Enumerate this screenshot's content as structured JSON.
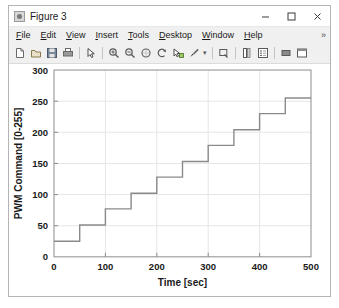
{
  "window": {
    "title": "Figure 3",
    "icon": "matlab-figure-icon",
    "controls": {
      "minimize": "minimize-icon",
      "maximize": "maximize-icon",
      "close": "close-icon"
    }
  },
  "menu": {
    "items": [
      {
        "label": "File",
        "mnemonic": "F"
      },
      {
        "label": "Edit",
        "mnemonic": "E"
      },
      {
        "label": "View",
        "mnemonic": "V"
      },
      {
        "label": "Insert",
        "mnemonic": "I"
      },
      {
        "label": "Tools",
        "mnemonic": "T"
      },
      {
        "label": "Desktop",
        "mnemonic": "D"
      },
      {
        "label": "Window",
        "mnemonic": "W"
      },
      {
        "label": "Help",
        "mnemonic": "H"
      }
    ],
    "overflow": "»"
  },
  "toolbar": {
    "groups": [
      [
        "new-figure-icon",
        "open-file-icon",
        "save-figure-icon",
        "print-figure-icon"
      ],
      [
        "pointer-icon"
      ],
      [
        "zoom-in-icon",
        "zoom-out-icon",
        "pan-icon",
        "rotate-3d-icon",
        "data-cursor-icon",
        "brush-icon"
      ],
      [
        "link-plot-icon"
      ],
      [
        "insert-colorbar-icon",
        "insert-legend-icon"
      ],
      [
        "hide-plot-tools-icon",
        "show-plot-tools-icon"
      ]
    ]
  },
  "chart_data": {
    "type": "line",
    "title": "",
    "xlabel": "Time [sec]",
    "ylabel": "PWM Command [0-255]",
    "xlim": [
      0,
      500
    ],
    "ylim": [
      0,
      300
    ],
    "xticks": [
      0,
      100,
      200,
      300,
      400,
      500
    ],
    "yticks": [
      0,
      50,
      100,
      150,
      200,
      250,
      300
    ],
    "grid": true,
    "legend": null,
    "line_color": "#8a8a8a",
    "series": [
      {
        "name": "PWM staircase command",
        "step": "post",
        "x": [
          0,
          50,
          50,
          100,
          100,
          150,
          150,
          200,
          200,
          250,
          250,
          300,
          300,
          350,
          350,
          400,
          400,
          450,
          450,
          500
        ],
        "y": [
          25,
          25,
          51,
          51,
          77,
          77,
          102,
          102,
          128,
          128,
          153,
          153,
          179,
          179,
          204,
          204,
          230,
          230,
          255,
          255
        ],
        "levels": [
          25,
          51,
          77,
          102,
          128,
          153,
          179,
          204,
          230,
          255
        ],
        "level_start_times": [
          0,
          50,
          100,
          150,
          200,
          250,
          300,
          350,
          400,
          450
        ]
      }
    ]
  }
}
